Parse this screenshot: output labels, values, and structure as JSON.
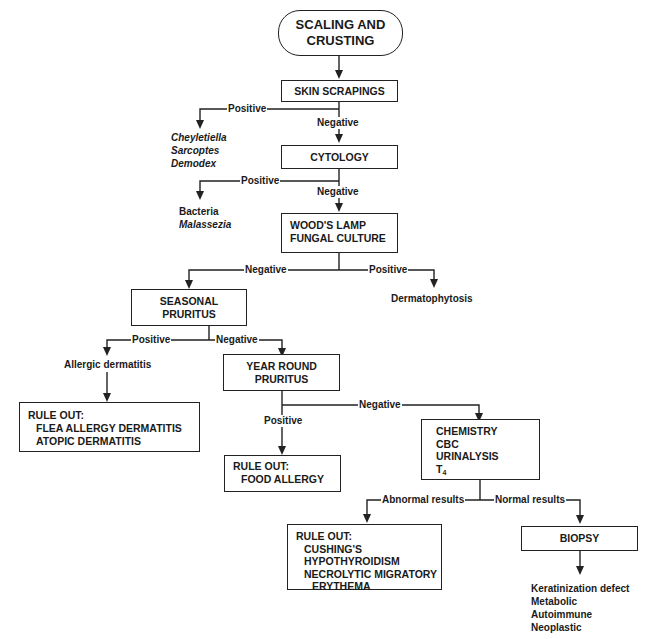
{
  "nodes": {
    "start": {
      "line1": "SCALING AND",
      "line2": "CRUSTING"
    },
    "skin_scrapings": {
      "label": "SKIN SCRAPINGS"
    },
    "cytology": {
      "label": "CYTOLOGY"
    },
    "woods_lamp": {
      "line1": "WOOD'S LAMP",
      "line2": "FUNGAL CULTURE"
    },
    "seasonal": {
      "line1": "SEASONAL",
      "line2": "PRURITUS"
    },
    "year_round": {
      "line1": "YEAR ROUND",
      "line2": "PRURITUS"
    },
    "rule_out_allergy": {
      "heading": "RULE OUT:",
      "items": [
        "FLEA ALLERGY DERMATITIS",
        "ATOPIC DERMATITIS"
      ]
    },
    "rule_out_food": {
      "heading": "RULE OUT:",
      "items": [
        "FOOD ALLERGY"
      ]
    },
    "lab_tests": {
      "items": [
        "CHEMISTRY",
        "CBC",
        "URINALYSIS",
        "T",
        "4"
      ]
    },
    "rule_out_endocrine": {
      "heading": "RULE OUT:",
      "items": [
        "CUSHING'S",
        "HYPOTHYROIDISM",
        "NECROLYTIC MIGRATORY",
        "ERYTHEMA"
      ]
    },
    "biopsy": {
      "label": "BIOPSY"
    }
  },
  "outcomes": {
    "parasites": [
      "Cheyletiella",
      "Sarcoptes",
      "Demodex"
    ],
    "infection": {
      "plain": "Bacteria",
      "italic": "Malassezia"
    },
    "fungal": "Dermatophytosis",
    "allergic": "Allergic dermatitis",
    "biopsy_results": [
      "Keratinization defect",
      "Metabolic",
      "Autoimmune",
      "Neoplastic"
    ]
  },
  "edge_labels": {
    "scrapings_positive": "Positive",
    "scrapings_negative": "Negative",
    "cytology_positive": "Positive",
    "cytology_negative": "Negative",
    "woods_negative": "Negative",
    "woods_positive": "Positive",
    "seasonal_positive": "Positive",
    "seasonal_negative": "Negative",
    "yearround_positive": "Positive",
    "yearround_negative": "Negative",
    "lab_abnormal": "Abnormal results",
    "lab_normal": "Normal results"
  },
  "colors": {
    "line": "#222222",
    "background": "#ffffff"
  }
}
